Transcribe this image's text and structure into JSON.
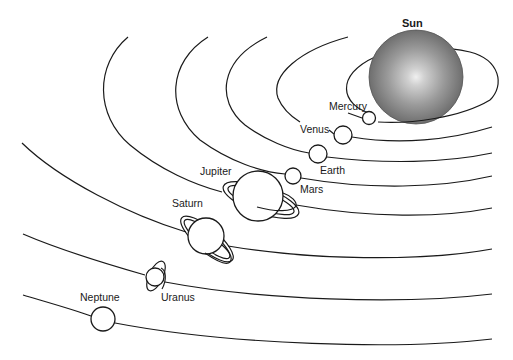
{
  "diagram": {
    "colors": {
      "line": "#1a1a1a",
      "background": "#ffffff",
      "sun_outer": "#7a7a7a",
      "sun_inner": "#e8e8e8"
    },
    "bodies": [
      {
        "id": "sun",
        "label": "Sun"
      },
      {
        "id": "mercury",
        "label": "Mercury"
      },
      {
        "id": "venus",
        "label": "Venus"
      },
      {
        "id": "earth",
        "label": "Earth"
      },
      {
        "id": "mars",
        "label": "Mars"
      },
      {
        "id": "jupiter",
        "label": "Jupiter"
      },
      {
        "id": "saturn",
        "label": "Saturn"
      },
      {
        "id": "uranus",
        "label": "Uranus"
      },
      {
        "id": "neptune",
        "label": "Neptune"
      }
    ]
  }
}
